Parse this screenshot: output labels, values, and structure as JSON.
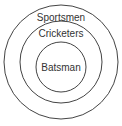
{
  "diagram": {
    "type": "nested-venn",
    "circles": [
      {
        "label": "Sportsmen",
        "cx": 61,
        "cy": 62,
        "r": 57
      },
      {
        "label": "Cricketers",
        "cx": 61,
        "cy": 62,
        "r": 41
      },
      {
        "label": "Batsman",
        "cx": 61,
        "cy": 67,
        "r": 25
      }
    ],
    "colors": {
      "stroke": "#444444",
      "text": "#333333",
      "background": "#ffffff"
    }
  }
}
